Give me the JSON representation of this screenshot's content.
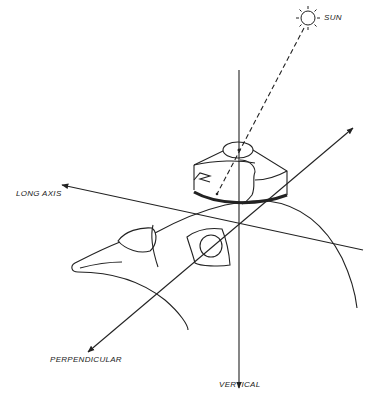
{
  "diagram": {
    "labels": {
      "sun": "SUN",
      "long_axis": "LONG AXIS",
      "perpendicular": "PERPENDICULAR",
      "vertical": "VERTICAL"
    },
    "colors": {
      "ink": "#222222",
      "background": "#ffffff"
    }
  }
}
